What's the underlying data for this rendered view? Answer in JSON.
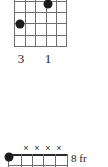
{
  "page": {
    "kind": "guitar-chord-chart",
    "background_color": "#ffffff",
    "ink_color": "#1a1a1a",
    "grid_color": "#6e6e6e",
    "dot_color": "#1c1c1c"
  },
  "diagrams": [
    {
      "id": "chord-diagram-top",
      "strings": 6,
      "frets": 5,
      "cropped_edge": "top",
      "nut_shown": false,
      "position_label": "",
      "dots": [
        {
          "name": "finger-dot-string5",
          "string_index": 4,
          "fret": 2,
          "x": 48,
          "y": 4
        },
        {
          "name": "finger-dot-string2",
          "string_index": 1,
          "fret": 3,
          "x": 20,
          "y": 24
        }
      ],
      "mutes": [],
      "finger_numbers": [
        {
          "label": "3",
          "x": 21
        },
        {
          "label": "1",
          "x": 48
        }
      ]
    },
    {
      "id": "chord-diagram-bottom",
      "strings": 6,
      "frets": 5,
      "cropped_edge": "bottom",
      "nut_shown": true,
      "position_label": "8 fr",
      "dots": [
        {
          "name": "barre-dot-string1",
          "string_index": 0,
          "fret": 1,
          "x": 9,
          "y": 17
        }
      ],
      "mutes": [
        {
          "label": "×",
          "x": 26
        },
        {
          "label": "×",
          "x": 37
        },
        {
          "label": "×",
          "x": 48
        },
        {
          "label": "×",
          "x": 59
        }
      ],
      "finger_numbers": []
    }
  ]
}
